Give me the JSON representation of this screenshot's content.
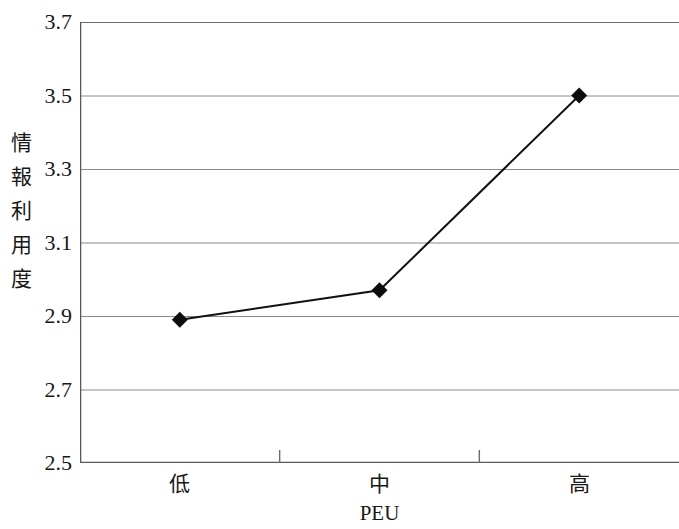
{
  "chart_data": {
    "type": "line",
    "title": "",
    "subtitle": "",
    "xlabel": "PEU",
    "ylabel": "情報利用度",
    "categories": [
      "低",
      "中",
      "高"
    ],
    "values": [
      2.89,
      2.97,
      3.5
    ],
    "series": [
      {
        "name": "情報利用度",
        "values": [
          2.89,
          2.97,
          3.5
        ],
        "marker": "diamond",
        "color": "#000000"
      }
    ],
    "ylim": [
      2.5,
      3.7
    ],
    "ytick_step": 0.2,
    "ytick_labels": [
      "3.7",
      "3.5",
      "3.3",
      "3.1",
      "2.9",
      "2.7",
      "2.5"
    ],
    "ytick_values": [
      3.7,
      3.5,
      3.3,
      3.1,
      2.9,
      2.7,
      2.5
    ],
    "xtick_labels": [
      "低",
      "中",
      "高"
    ],
    "grid": true,
    "grid_axis": "y",
    "legend": false,
    "legend_position": "none",
    "colors": {
      "line": "#000000",
      "marker": "#000000",
      "grid": "#808080",
      "axis": "#555555",
      "text": "#171717",
      "background": "#ffffff"
    }
  },
  "axes": {
    "y_title_chars": [
      "情",
      "報",
      "利",
      "用",
      "度"
    ],
    "y_ticks": [
      {
        "label": "3.7",
        "value": 3.7
      },
      {
        "label": "3.5",
        "value": 3.5
      },
      {
        "label": "3.3",
        "value": 3.3
      },
      {
        "label": "3.1",
        "value": 3.1
      },
      {
        "label": "2.9",
        "value": 2.9
      },
      {
        "label": "2.7",
        "value": 2.7
      },
      {
        "label": "2.5",
        "value": 2.5
      }
    ],
    "x_ticks": [
      {
        "label": "低",
        "value": 0
      },
      {
        "label": "中",
        "value": 1
      },
      {
        "label": "高",
        "value": 2
      }
    ],
    "x_title": "PEU"
  }
}
